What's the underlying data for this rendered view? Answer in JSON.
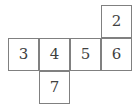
{
  "figure": {
    "name": "cube-net-diagram",
    "grid": {
      "origin_x": 8,
      "origin_y": 5,
      "cell_width": 31,
      "cell_height": 33
    },
    "style": {
      "background": "#ffffff",
      "border_color": "#808080",
      "text_color": "#404040"
    },
    "cells": [
      {
        "label": "2",
        "col": 3,
        "row": 0
      },
      {
        "label": "3",
        "col": 0,
        "row": 1
      },
      {
        "label": "4",
        "col": 1,
        "row": 1
      },
      {
        "label": "5",
        "col": 2,
        "row": 1
      },
      {
        "label": "6",
        "col": 3,
        "row": 1
      },
      {
        "label": "7",
        "col": 1,
        "row": 2
      }
    ]
  }
}
